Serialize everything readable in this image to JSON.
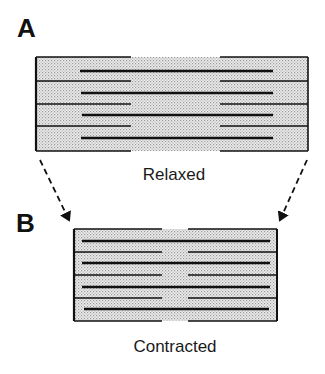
{
  "panels": [
    {
      "id": "A",
      "label": "A",
      "caption": "Relaxed",
      "label_pos": [
        17,
        37
      ],
      "caption_pos": [
        174,
        180
      ],
      "box": {
        "x": 36,
        "y": 57,
        "w": 272,
        "h": 94
      },
      "separators_y": [
        81,
        104,
        126
      ],
      "thick_lines_y": [
        71,
        93,
        115,
        138
      ],
      "thick_x": [
        80,
        273
      ],
      "thin_left_x": [
        36,
        131
      ],
      "thin_right_x": [
        220,
        308
      ]
    },
    {
      "id": "B",
      "label": "B",
      "caption": "Contracted",
      "label_pos": [
        16,
        232
      ],
      "caption_pos": [
        175,
        352
      ],
      "box": {
        "x": 74,
        "y": 229,
        "w": 203,
        "h": 92
      },
      "separators_y": [
        252,
        275,
        298
      ],
      "thick_lines_y": [
        241,
        263,
        287,
        309
      ],
      "thick_x": [
        82,
        270
      ],
      "thin_left_x": [
        74,
        162
      ],
      "thin_right_x": [
        188,
        277
      ]
    }
  ],
  "arrows": [
    {
      "name": "left-arrow",
      "from": [
        40,
        160
      ],
      "to": [
        70,
        222
      ]
    },
    {
      "name": "right-arrow",
      "from": [
        307,
        160
      ],
      "to": [
        279,
        222
      ]
    }
  ],
  "colors": {
    "stroke": "#111111",
    "fill_dots": "#c9c9c9",
    "background": "#ffffff"
  }
}
